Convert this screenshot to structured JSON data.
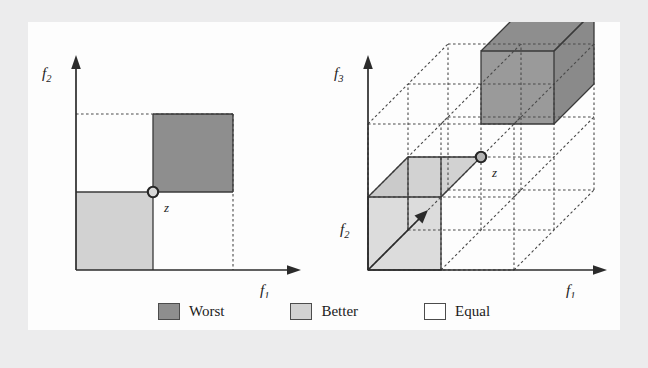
{
  "figure": {
    "background_color": "#ececed",
    "panel_color": "#fdfdfd",
    "colors": {
      "worst": "#8e8e8e",
      "better": "#d2d2d2",
      "equal": "#ffffff",
      "axis": "#2b2b2b",
      "dashed_grid": "#4a4a4a",
      "solid_edge": "#3a3a3a"
    }
  },
  "left_plot": {
    "name": "two-objective-dominance-diagram",
    "y_axis_label": "f",
    "y_axis_subscript": "2",
    "x_axis_label": "f",
    "x_axis_subscript": "1",
    "point_label": "z",
    "regions": [
      {
        "name": "worst",
        "quadrant": "upper-right",
        "fill": "worst"
      },
      {
        "name": "better",
        "quadrant": "lower-left",
        "fill": "better"
      },
      {
        "name": "equal-upper-left",
        "quadrant": "upper-left",
        "fill": "equal"
      },
      {
        "name": "equal-lower-right",
        "quadrant": "lower-right",
        "fill": "equal"
      }
    ]
  },
  "right_plot": {
    "name": "three-objective-dominance-diagram",
    "y_axis_label": "f",
    "y_axis_subscript": "3",
    "depth_axis_label": "f",
    "depth_axis_subscript": "2",
    "x_axis_label": "f",
    "x_axis_subscript": "1",
    "point_label": "z",
    "grid_divisions": 2,
    "regions": [
      {
        "name": "worst",
        "octant": "top-right-back",
        "fill": "worst"
      },
      {
        "name": "better",
        "octant": "bottom-left-front",
        "fill": "better"
      }
    ]
  },
  "legend": {
    "items": [
      {
        "label": "Worst",
        "color": "#8e8e8e"
      },
      {
        "label": "Better",
        "color": "#d2d2d2"
      },
      {
        "label": "Equal",
        "color": "#ffffff"
      }
    ]
  }
}
